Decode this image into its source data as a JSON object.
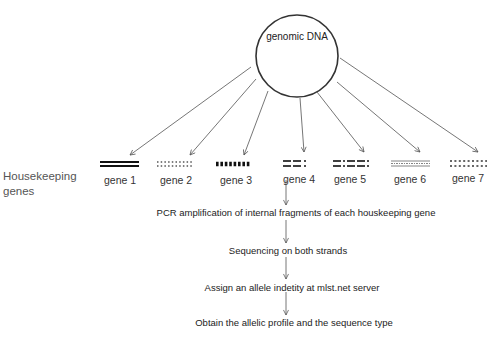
{
  "diagram": {
    "source": {
      "label": "genomic DNA"
    },
    "group_label": "Housekeeping genes",
    "group_label_lines": [
      "Housekeeping",
      "genes"
    ],
    "genes": [
      {
        "label": "gene 1",
        "pattern": "double-solid-line"
      },
      {
        "label": "gene 2",
        "pattern": "dotted-double-row"
      },
      {
        "label": "gene 3",
        "pattern": "heavy-dashed-blocks"
      },
      {
        "label": "gene 4",
        "pattern": "dash-dash-colon"
      },
      {
        "label": "gene 5",
        "pattern": "dash-colon-dash-dash-colon"
      },
      {
        "label": "gene 6",
        "pattern": "fine-striped-bar"
      },
      {
        "label": "gene 7",
        "pattern": "dotted-double-row-light"
      }
    ],
    "steps": [
      {
        "label": "PCR amplification of internal fragments of each houskeeping gene"
      },
      {
        "label": "Sequencing on both strands"
      },
      {
        "label": "Assign an allele indetity at mlst.net server"
      },
      {
        "label": "Obtain the allelic profile and the sequence type"
      }
    ],
    "colors": {
      "line": "#555555",
      "circle": "#333333",
      "text": "#222222",
      "muted_text": "#555555"
    }
  }
}
